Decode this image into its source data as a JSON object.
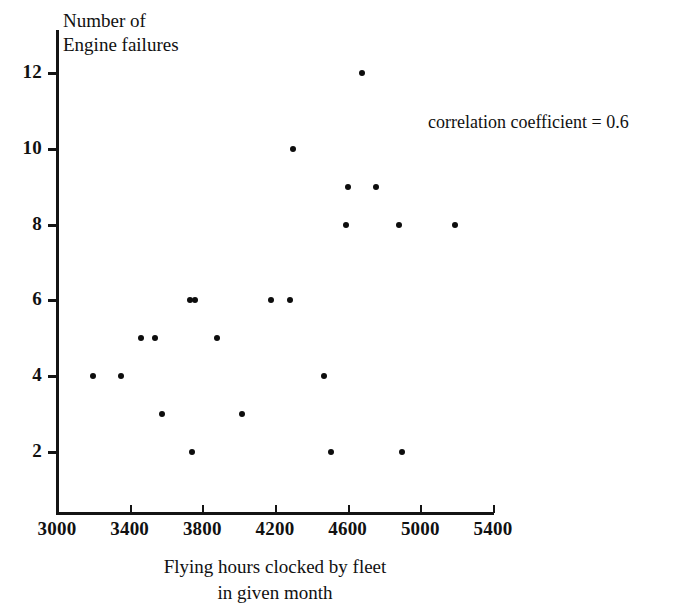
{
  "chart_data": {
    "type": "scatter",
    "title": "",
    "xlabel": "Flying hours clocked by fleet\nin given month",
    "ylabel": "Number of\nEngine failures",
    "xlim": [
      3000,
      5400
    ],
    "ylim": [
      0,
      13
    ],
    "xticks": [
      3000,
      3400,
      3800,
      4200,
      4600,
      5000,
      5400
    ],
    "xtick_labels": [
      "3000",
      "3400",
      "3800",
      "4200",
      "4600",
      "5000",
      "5400"
    ],
    "yticks": [
      2,
      4,
      6,
      8,
      10,
      12
    ],
    "ytick_labels": [
      "2",
      "4",
      "6",
      "8",
      "10",
      "12"
    ],
    "grid": false,
    "legend": null,
    "annotations": [
      {
        "text": "correlation coefficient = 0.6",
        "x": 5050,
        "y": 10.6
      }
    ],
    "series": [
      {
        "name": "engine failures vs flying hours",
        "marker": "filled-circle",
        "color": "#0d0d0d",
        "points": [
          {
            "x": 3200,
            "y": 4
          },
          {
            "x": 3350,
            "y": 4
          },
          {
            "x": 3460,
            "y": 5
          },
          {
            "x": 3540,
            "y": 5
          },
          {
            "x": 3580,
            "y": 3
          },
          {
            "x": 3730,
            "y": 6
          },
          {
            "x": 3760,
            "y": 6
          },
          {
            "x": 3745,
            "y": 2
          },
          {
            "x": 3880,
            "y": 5
          },
          {
            "x": 4020,
            "y": 3
          },
          {
            "x": 4180,
            "y": 6
          },
          {
            "x": 4285,
            "y": 6
          },
          {
            "x": 4300,
            "y": 10
          },
          {
            "x": 4470,
            "y": 4
          },
          {
            "x": 4510,
            "y": 2
          },
          {
            "x": 4590,
            "y": 8
          },
          {
            "x": 4600,
            "y": 9
          },
          {
            "x": 4680,
            "y": 12
          },
          {
            "x": 4755,
            "y": 9
          },
          {
            "x": 4885,
            "y": 8
          },
          {
            "x": 4900,
            "y": 2
          },
          {
            "x": 5190,
            "y": 8
          }
        ]
      }
    ]
  },
  "figure": {
    "background_color": "#ffffff",
    "ink_color": "#0d0d0d"
  }
}
